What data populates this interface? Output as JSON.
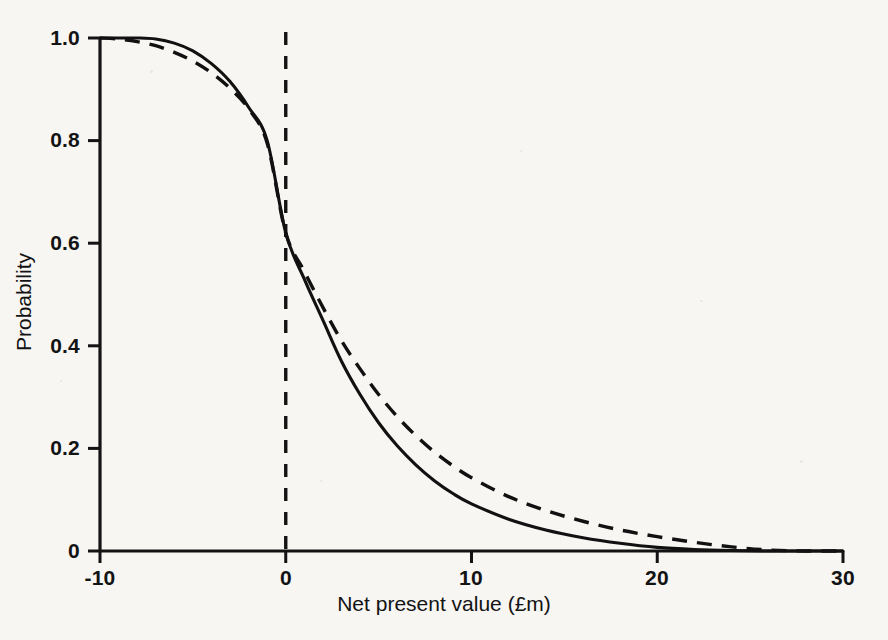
{
  "chart_data": {
    "type": "line",
    "title": "",
    "subtitle": "",
    "xlabel": "Net present value (£m)",
    "ylabel": "Probability",
    "xlim": [
      -10,
      30
    ],
    "ylim": [
      0,
      1.0
    ],
    "xticks": [
      "-10",
      "0",
      "10",
      "20",
      "30"
    ],
    "xtick_values": [
      -10,
      0,
      10,
      20,
      30
    ],
    "yticks": [
      "0",
      "0.2",
      "0.4",
      "0.6",
      "0.8",
      "1.0"
    ],
    "ytick_values": [
      0,
      0.2,
      0.4,
      0.6,
      0.8,
      1.0
    ],
    "grid": false,
    "legend": "none",
    "annotations": [
      {
        "name": "zero-npv-reference-line",
        "type": "vertical-dashed-line",
        "x": 0,
        "label": ""
      }
    ],
    "x": [
      -10,
      -9,
      -8,
      -7,
      -6,
      -5,
      -4,
      -3,
      -2,
      -1,
      0,
      1,
      2,
      3,
      4,
      5,
      6,
      7,
      8,
      9,
      10,
      12,
      14,
      16,
      18,
      20,
      22,
      24,
      26,
      28,
      30
    ],
    "series": [
      {
        "name": "Solid curve",
        "style": "solid",
        "color": "#111111",
        "values": [
          1.0,
          1.0,
          1.0,
          0.998,
          0.99,
          0.975,
          0.95,
          0.915,
          0.865,
          0.8,
          0.62,
          0.53,
          0.45,
          0.37,
          0.305,
          0.25,
          0.205,
          0.168,
          0.137,
          0.112,
          0.092,
          0.062,
          0.041,
          0.026,
          0.015,
          0.007,
          0.003,
          0.001,
          0.0,
          0.0,
          0.0
        ]
      },
      {
        "name": "Dashed curve",
        "style": "dashed",
        "color": "#111111",
        "values": [
          1.0,
          0.998,
          0.993,
          0.985,
          0.972,
          0.955,
          0.932,
          0.902,
          0.862,
          0.795,
          0.62,
          0.545,
          0.475,
          0.41,
          0.355,
          0.305,
          0.262,
          0.225,
          0.193,
          0.166,
          0.143,
          0.106,
          0.079,
          0.058,
          0.041,
          0.028,
          0.017,
          0.008,
          0.002,
          0.0,
          0.0
        ]
      }
    ],
    "crossing_point": {
      "x": 0,
      "y": 0.62
    }
  }
}
